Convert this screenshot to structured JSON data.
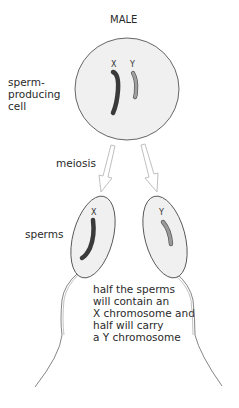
{
  "title": "MALE",
  "labels": {
    "cell": [
      "sperm-",
      "producing",
      "cell"
    ],
    "process": "meiosis",
    "gametes": "sperms",
    "note": [
      "half the sperms",
      "will contain an",
      "X chromosome and",
      "half will carry",
      "a Y chromosome"
    ]
  },
  "chromosomes": {
    "x_label": "X",
    "y_label": "Y"
  },
  "colors": {
    "cell_fill": "#f0f0f0",
    "outline": "#555555",
    "x_chromosome": "#3a3a3a",
    "y_chromosome": "#9a9a9a",
    "arrow": "#b8b8b8"
  }
}
